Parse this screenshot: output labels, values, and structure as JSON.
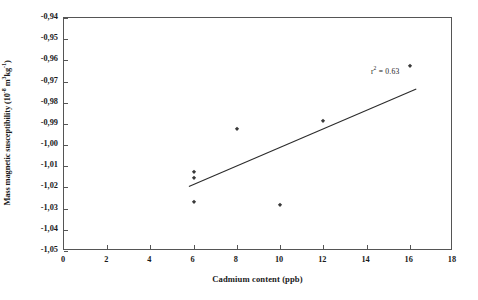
{
  "chart_data": {
    "type": "scatter",
    "title": "",
    "xlabel": "Cadmium content (ppb)",
    "ylabel": "Mass magnetic susceptibility (10 -8 m3kg-1)",
    "ylabel_parts": {
      "main": "Mass magnetic susceptibility (10",
      "exp1": "-8",
      "mid": " m",
      "exp2": "3",
      "unit": "kg",
      "exp3": "-1",
      "close": ")"
    },
    "xlim": [
      0,
      18
    ],
    "ylim": [
      -1.05,
      -0.94
    ],
    "xticks": [
      0,
      2,
      4,
      6,
      8,
      10,
      12,
      14,
      16,
      18
    ],
    "xtick_labels": [
      "0",
      "2",
      "4",
      "6",
      "8",
      "10",
      "12",
      "14",
      "16",
      "18"
    ],
    "yticks": [
      -0.94,
      -0.95,
      -0.96,
      -0.97,
      -0.98,
      -0.99,
      -1.0,
      -1.01,
      -1.02,
      -1.03,
      -1.04,
      -1.05
    ],
    "ytick_labels": [
      "-0,94",
      "-0,95",
      "-0,96",
      "-0,97",
      "-0,98",
      "-0,99",
      "-1,00",
      "-1,01",
      "-1,02",
      "-1,03",
      "-1,04",
      "-1,05"
    ],
    "grid": false,
    "legend": false,
    "points": [
      {
        "x": 6,
        "y": -1.0125
      },
      {
        "x": 6,
        "y": -1.0155
      },
      {
        "x": 6,
        "y": -1.027
      },
      {
        "x": 8,
        "y": -0.9925
      },
      {
        "x": 10,
        "y": -1.0285
      },
      {
        "x": 12,
        "y": -0.9885
      },
      {
        "x": 16,
        "y": -0.9625
      }
    ],
    "marker_color": "#3a3a3a",
    "trendline": {
      "type": "linear",
      "x_start": 5.78,
      "y_start": -1.0195,
      "x_end": 16.3,
      "y_end": -0.9735,
      "color": "#2b2b2b",
      "width": 1.1
    },
    "annotations": [
      {
        "text_main": "r",
        "text_sup": "2",
        "text_rest": " = 0.63",
        "full_text": "r2 = 0.63",
        "x": 14.2,
        "y": -0.9655
      }
    ],
    "axis_color": "#555555"
  }
}
